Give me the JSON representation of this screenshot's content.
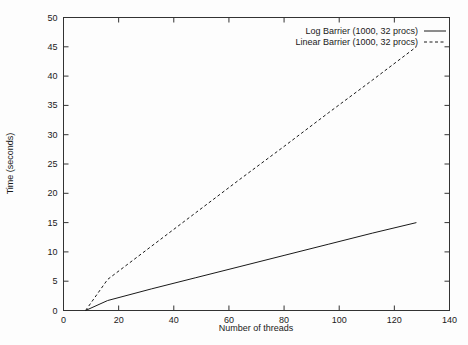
{
  "chart_data": {
    "type": "line",
    "title": "",
    "xlabel": "Number of threads",
    "ylabel": "Time (seconds)",
    "xlim": [
      0,
      140
    ],
    "ylim": [
      0,
      50
    ],
    "x_ticks": [
      0,
      20,
      40,
      60,
      80,
      100,
      120,
      140
    ],
    "y_ticks": [
      0,
      5,
      10,
      15,
      20,
      25,
      30,
      35,
      40,
      45,
      50
    ],
    "grid": false,
    "legend_position": "top-right-inside",
    "background_color": "#fdfdfd",
    "frame_color": "#333333",
    "text_color": "#1a1a1a",
    "series": [
      {
        "name": "Log Barrier (1000, 32 procs)",
        "style": "solid",
        "color": "#1a1a1a",
        "points": [
          [
            8,
            0
          ],
          [
            16,
            1.7
          ],
          [
            32,
            3.7
          ],
          [
            48,
            5.6
          ],
          [
            64,
            7.5
          ],
          [
            80,
            9.4
          ],
          [
            96,
            11.3
          ],
          [
            112,
            13.2
          ],
          [
            128,
            15
          ]
        ]
      },
      {
        "name": "Linear Barrier (1000, 32 procs)",
        "style": "dashed",
        "color": "#1a1a1a",
        "points": [
          [
            8,
            0
          ],
          [
            16,
            5.3
          ],
          [
            32,
            11
          ],
          [
            48,
            16.7
          ],
          [
            64,
            22.4
          ],
          [
            80,
            28
          ],
          [
            96,
            33.7
          ],
          [
            112,
            39.3
          ],
          [
            128,
            45
          ]
        ]
      }
    ]
  }
}
